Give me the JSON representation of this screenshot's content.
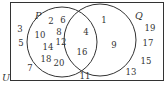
{
  "diagram": {
    "type": "venn",
    "universe_label": "U",
    "sets": [
      {
        "label": "P",
        "circle": {
          "cx": 62,
          "cy": 42,
          "r": 35
        }
      },
      {
        "label": "Q",
        "circle": {
          "cx": 100,
          "cy": 40,
          "r": 36
        }
      }
    ],
    "regions": {
      "only_U": [
        "3",
        "5",
        "7",
        "11",
        "13",
        "15",
        "17",
        "19"
      ],
      "only_P": [
        "2",
        "6",
        "8",
        "10",
        "12",
        "14",
        "18",
        "20"
      ],
      "P_and_Q": [
        "4",
        "16"
      ],
      "only_Q": [
        "1",
        "9"
      ]
    },
    "numbers": [
      {
        "v": "3",
        "x": 20,
        "y": 32
      },
      {
        "v": "5",
        "x": 21,
        "y": 46
      },
      {
        "v": "7",
        "x": 30,
        "y": 71
      },
      {
        "v": "2",
        "x": 51,
        "y": 24
      },
      {
        "v": "6",
        "x": 63,
        "y": 23
      },
      {
        "v": "10",
        "x": 40,
        "y": 38
      },
      {
        "v": "8",
        "x": 59,
        "y": 35
      },
      {
        "v": "12",
        "x": 61,
        "y": 45
      },
      {
        "v": "14",
        "x": 48,
        "y": 50
      },
      {
        "v": "18",
        "x": 46,
        "y": 62
      },
      {
        "v": "20",
        "x": 59,
        "y": 66
      },
      {
        "v": "4",
        "x": 86,
        "y": 35
      },
      {
        "v": "16",
        "x": 82,
        "y": 55
      },
      {
        "v": "1",
        "x": 104,
        "y": 23
      },
      {
        "v": "9",
        "x": 114,
        "y": 48
      },
      {
        "v": "11",
        "x": 85,
        "y": 79
      },
      {
        "v": "13",
        "x": 131,
        "y": 75
      },
      {
        "v": "19",
        "x": 150,
        "y": 31
      },
      {
        "v": "17",
        "x": 148,
        "y": 46
      },
      {
        "v": "15",
        "x": 146,
        "y": 64
      }
    ],
    "labels": [
      {
        "v": "P",
        "x": 35,
        "y": 19
      },
      {
        "v": "Q",
        "x": 135,
        "y": 19
      },
      {
        "v": "U",
        "x": 2,
        "y": 81
      }
    ],
    "colors": {
      "stroke": "#333333",
      "background": "#ffffff"
    }
  }
}
